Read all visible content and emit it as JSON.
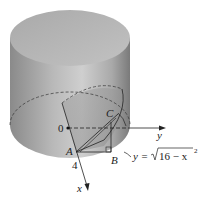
{
  "figure": {
    "labels": {
      "origin": "0",
      "point_a": "A",
      "point_b": "B",
      "point_c": "C",
      "radius": "4",
      "x_axis": "x",
      "y_axis": "y",
      "equation_prefix": "y =",
      "equation_radicand": "16 − x",
      "equation_exponent": "2"
    },
    "colors": {
      "cylinder_side_light": "#c9c9c9",
      "cylinder_side_dark": "#7d7d7d",
      "cylinder_top": "#b5b5b5",
      "lines": "#222222",
      "background": "#ffffff"
    }
  }
}
